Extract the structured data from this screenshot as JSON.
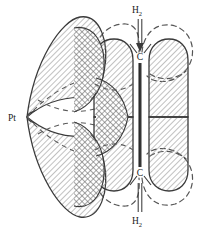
{
  "labels": {
    "metal": "Pt",
    "carbon_top": "C",
    "carbon_bottom": "C",
    "hydrogen_top": "H",
    "hydrogen_top_sub": "2",
    "hydrogen_bottom": "H",
    "hydrogen_bottom_sub": "2"
  },
  "colors": {
    "stroke": "#3a3a3a",
    "hatch": "#8c8c8c",
    "hatch_dense": "#6b6b6b",
    "dashed": "#555555",
    "bond": "#2b2b2b",
    "background": "#ffffff",
    "text": "#1a1a1a"
  },
  "geometry": {
    "metal_vertex_x": 27,
    "metal_vertex_y": 117,
    "carbon_top_x": 140,
    "carbon_top_y": 57,
    "carbon_bottom_x": 140,
    "carbon_bottom_y": 172,
    "bond_line_x": 140,
    "bond_top_y": 62,
    "bond_bottom_y": 168
  },
  "elements": {
    "metal_lobe_upper": "d-orbital-lobe-upper",
    "metal_lobe_lower": "d-orbital-lobe-lower",
    "pi_orbital_left_upper": "ethylene-pi-lobe-left-upper",
    "pi_orbital_left_lower": "ethylene-pi-lobe-left-lower",
    "pi_orbital_right_upper": "ethylene-pi-lobe-right-upper",
    "pi_orbital_right_lower": "ethylene-pi-lobe-right-lower",
    "dashed_outline_count": 4
  }
}
